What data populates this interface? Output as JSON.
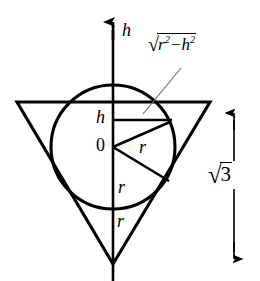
{
  "figure": {
    "background_color": "#ffffff",
    "stroke_color": "#000000",
    "labels": {
      "axis_h": "h",
      "segment_h": "h",
      "origin": "0",
      "radius_upper": "r",
      "radius_middle": "r",
      "radius_lower": "r",
      "chord_expression": {
        "radical_sign": "√",
        "radicand_base_1": "r",
        "radicand_exponent_1": "2",
        "operator": "−",
        "radicand_base_2": "h",
        "radicand_exponent_2": "2",
        "plain": "√(r² − h²)"
      },
      "height_measure": {
        "radical_sign": "√",
        "radicand": "3",
        "plain": "√3"
      }
    },
    "geometry": {
      "axis_x": 113,
      "axis_top_y": 18,
      "axis_bottom_y": 281,
      "circle_center_x": 113,
      "circle_center_y": 147,
      "circle_radius": 62,
      "triangle_left_x": 17,
      "triangle_right_x": 210,
      "triangle_top_y": 102,
      "triangle_apex_x": 113,
      "triangle_apex_y": 264,
      "chord_y": 120,
      "chord_right_x": 172,
      "radius_up_end_x": 170,
      "radius_up_end_y": 122,
      "radius_down_end_x": 169,
      "radius_down_end_y": 181,
      "leader_start_x": 181,
      "leader_start_y": 68,
      "leader_end_x": 143,
      "leader_end_y": 114,
      "measure_arrow_x": 234,
      "measure_arrow_top_y": 110,
      "measure_arrow_bottom_y": 262
    }
  }
}
